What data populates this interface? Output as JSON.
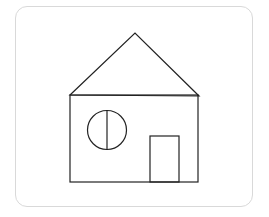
{
  "canvas": {
    "width": 269,
    "height": 217,
    "background": "#ffffff"
  },
  "frame": {
    "border_color": "#d9d9d9",
    "radius": 12
  },
  "drawing": {
    "subject": "house",
    "stroke_color": "#222222",
    "parts": [
      "roof-triangle",
      "house-body",
      "round-window",
      "window-divider",
      "door"
    ]
  }
}
